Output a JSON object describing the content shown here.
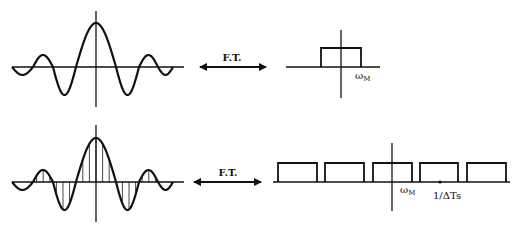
{
  "diagram": {
    "title": "",
    "rows": [
      {
        "id": "continuous",
        "time_signal": {
          "type": "sinc-like",
          "sampled": false
        },
        "transform_label": "F.T.",
        "spectrum": {
          "type": "single-rectangle",
          "label": "ωM",
          "label_main": "ω",
          "label_sub": "M"
        }
      },
      {
        "id": "sampled",
        "time_signal": {
          "type": "sinc-like",
          "sampled": true
        },
        "transform_label": "F.T.",
        "spectrum": {
          "type": "periodic-rectangles",
          "rectangle_count": 5,
          "labels": [
            {
              "text": "ωM",
              "main": "ω",
              "sub": "M"
            },
            {
              "text": "1/ΔTs"
            }
          ]
        }
      }
    ]
  },
  "colors": {
    "stroke": "#111111",
    "background": "#ffffff"
  }
}
